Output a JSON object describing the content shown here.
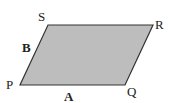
{
  "diagram": {
    "type": "parallelogram",
    "fill": "#bdbdbd",
    "stroke": "#333333",
    "vertices": {
      "P": {
        "label": "P",
        "x": 20,
        "y": 85
      },
      "Q": {
        "label": "Q",
        "x": 125,
        "y": 85
      },
      "R": {
        "label": "R",
        "x": 153,
        "y": 25
      },
      "S": {
        "label": "S",
        "x": 48,
        "y": 25
      }
    },
    "sides": {
      "A": {
        "label": "A",
        "between": "P-Q"
      },
      "B": {
        "label": "B",
        "between": "P-S"
      }
    }
  }
}
